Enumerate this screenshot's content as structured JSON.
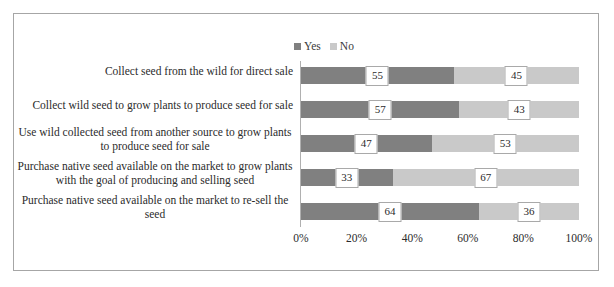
{
  "chart_data": {
    "type": "bar",
    "subtype": "100% stacked horizontal bar",
    "title": "",
    "xlabel": "",
    "ylabel": "",
    "xlim": [
      0,
      100
    ],
    "xticks": [
      "0%",
      "20%",
      "40%",
      "60%",
      "80%",
      "100%"
    ],
    "xtick_values": [
      0,
      20,
      40,
      60,
      80,
      100
    ],
    "grid": false,
    "legend_position": "top-center",
    "categories": [
      "Collect seed from the wild for direct sale",
      "Collect wild seed to grow plants to produce seed for sale",
      "Use wild collected seed from another source to grow plants to produce seed for sale",
      "Purchase native seed available on the market to grow plants with the goal of producing and selling seed",
      "Purchase native seed available on the market to re-sell the seed"
    ],
    "series": [
      {
        "name": "Yes",
        "color": "#808080",
        "values": [
          55,
          57,
          47,
          33,
          64
        ]
      },
      {
        "name": "No",
        "color": "#c9c9c9",
        "values": [
          45,
          43,
          53,
          67,
          36
        ]
      }
    ]
  },
  "legend": {
    "items": [
      {
        "label": "Yes",
        "color": "#808080"
      },
      {
        "label": "No",
        "color": "#c9c9c9"
      }
    ]
  },
  "rows": [
    {
      "label_lines": [
        "Collect seed from the wild for direct sale"
      ],
      "yes": 55,
      "no": 45,
      "yes_label": "55",
      "no_label": "45"
    },
    {
      "label_lines": [
        "Collect wild seed to grow plants to produce seed for sale"
      ],
      "yes": 57,
      "no": 43,
      "yes_label": "57",
      "no_label": "43"
    },
    {
      "label_lines": [
        "Use wild collected seed from another source to grow plants",
        "to produce seed for sale"
      ],
      "yes": 47,
      "no": 53,
      "yes_label": "47",
      "no_label": "53"
    },
    {
      "label_lines": [
        "Purchase native seed available on the market to grow plants",
        "with the goal of producing and selling seed"
      ],
      "yes": 33,
      "no": 67,
      "yes_label": "33",
      "no_label": "67"
    },
    {
      "label_lines": [
        "Purchase native seed available on the market to re-sell the",
        "seed"
      ],
      "yes": 64,
      "no": 36,
      "yes_label": "64",
      "no_label": "36"
    }
  ],
  "xaxis": {
    "ticks": [
      "0%",
      "20%",
      "40%",
      "60%",
      "80%",
      "100%"
    ]
  }
}
